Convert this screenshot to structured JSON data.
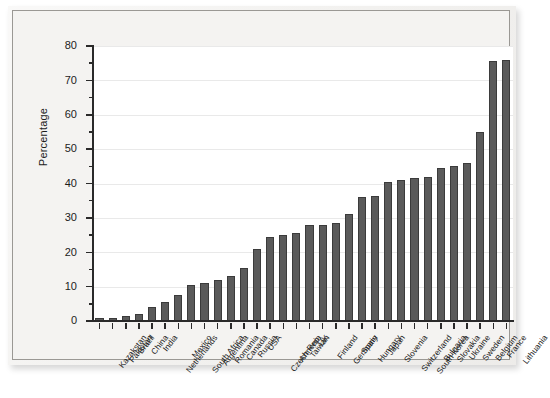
{
  "figure": {
    "kind": "bar-chart-figure",
    "background_color": "#f2f1ef",
    "plot_background_color": "#ffffff",
    "bar_fill_color": "#5a5a5a",
    "bar_edge_color": "#3b3b3b",
    "axis_color": "#2a2a2a",
    "gridline_color": "#e9e9e9"
  },
  "chart_data": {
    "type": "bar",
    "title": "",
    "xlabel": "",
    "ylabel": "Percentage",
    "ylim": [
      0,
      80
    ],
    "ytick_labels": [
      "0",
      "10",
      "20",
      "30",
      "40",
      "50",
      "60",
      "70",
      "80"
    ],
    "ytick_values": [
      0,
      10,
      20,
      30,
      40,
      50,
      60,
      70,
      80
    ],
    "yminor_interval": 5,
    "grid": "horizontal-major",
    "legend": "none",
    "categories": [
      "Kazakstan",
      "Pakistan",
      "Brazil",
      "China",
      "India",
      "Netherlands",
      "Mexico",
      "South Africa",
      "Argentina",
      "Romania",
      "Canada",
      "Russia",
      "USA",
      "Czech Rep.",
      "Armenia",
      "Taiwan",
      "UK",
      "Finland",
      "Germany",
      "Spain",
      "Hungary",
      "Japan",
      "Slovenia",
      "Switzerland",
      "South Korea",
      "Bulgaria",
      "Slovakia",
      "Ukraine",
      "Sweden",
      "Belgium",
      "France",
      "Lithuania"
    ],
    "values": [
      1,
      1,
      1.5,
      2,
      4,
      5.5,
      7.5,
      10.5,
      11,
      12,
      13,
      15.5,
      21,
      24.5,
      25,
      25.5,
      28,
      28,
      28.5,
      31,
      36,
      36.5,
      40.5,
      41,
      41.5,
      42,
      44.5,
      45,
      46,
      55,
      75.5,
      76
    ]
  }
}
